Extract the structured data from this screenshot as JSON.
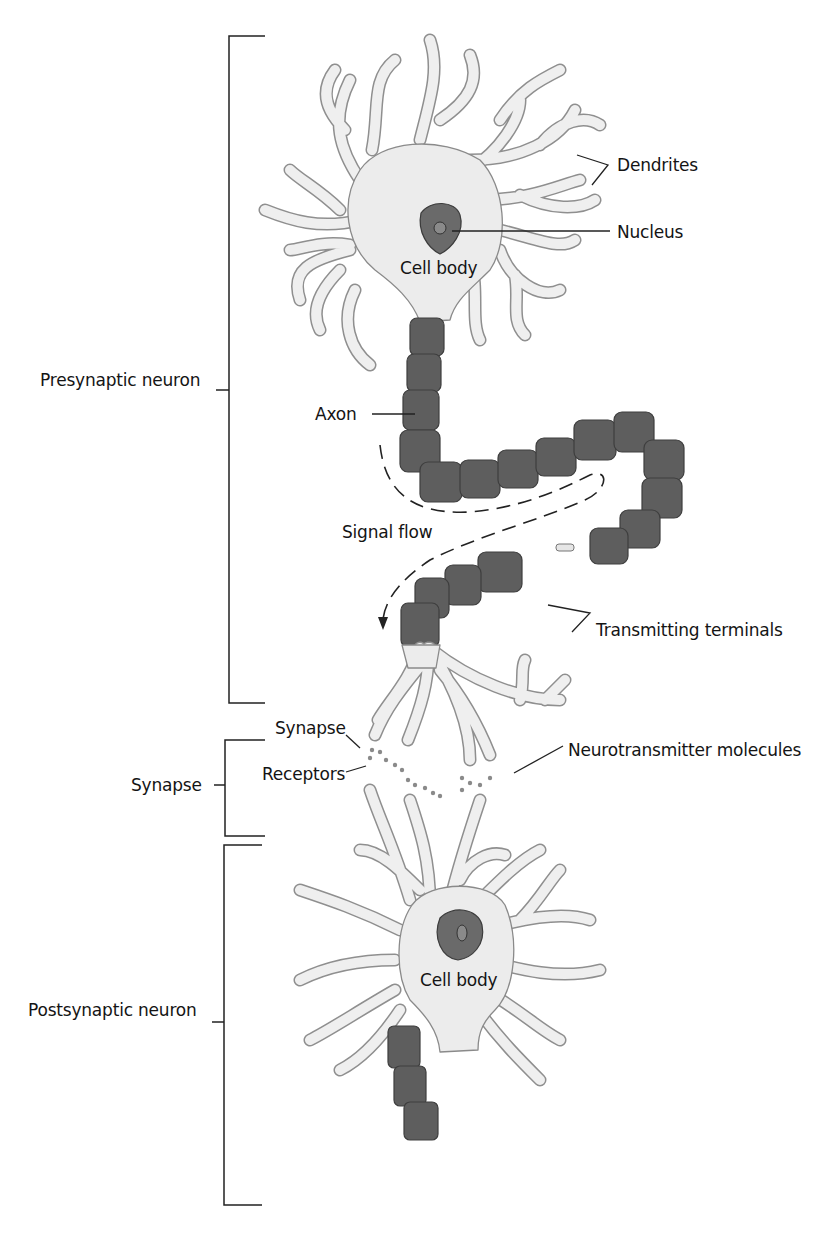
{
  "diagram": {
    "type": "anatomical-illustration",
    "brackets": [
      {
        "id": "presynaptic",
        "label": "Presynaptic neuron"
      },
      {
        "id": "synapse",
        "label": "Synapse"
      },
      {
        "id": "postsynaptic",
        "label": "Postsynaptic neuron"
      }
    ],
    "labels": {
      "dendrites": "Dendrites",
      "nucleus": "Nucleus",
      "cell_body_top": "Cell body",
      "axon": "Axon",
      "signal_flow": "Signal flow",
      "transmitting_terminals": "Transmitting terminals",
      "synapse_point": "Synapse",
      "receptors": "Receptors",
      "neurotransmitter_molecules": "Neurotransmitter molecules",
      "cell_body_bottom": "Cell body"
    },
    "colors": {
      "membrane_fill": "#ececec",
      "membrane_stroke": "#8a8a8a",
      "myelin": "#5e5e5e",
      "nucleus": "#6a6a6a",
      "text": "#141414"
    }
  }
}
